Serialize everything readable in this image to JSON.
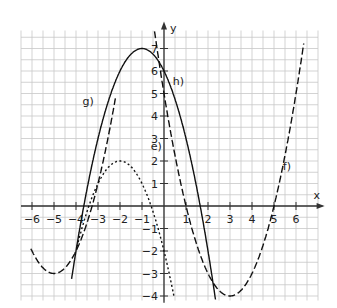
{
  "chart_data": {
    "type": "line",
    "title": "",
    "xlabel": "x",
    "ylabel": "y",
    "xlim": [
      -6.3,
      7
    ],
    "ylim": [
      -4.2,
      7.8
    ],
    "x_ticks": [
      -6,
      -5,
      -4,
      -3,
      -2,
      -1,
      1,
      2,
      3,
      4,
      5,
      6
    ],
    "y_ticks": [
      -4,
      -3,
      -2,
      -1,
      1,
      2,
      3,
      4,
      5,
      6,
      7
    ],
    "grid": true,
    "grid_step": 0.5,
    "series": [
      {
        "name": "e)",
        "style": "dotted",
        "formula": "-(x+2)^2+2",
        "vertex": [
          -2,
          2
        ],
        "points": [
          [
            -3.9,
            -1.6
          ],
          [
            -3,
            1
          ],
          [
            -2,
            2
          ],
          [
            -1,
            1
          ],
          [
            0,
            -2
          ],
          [
            0.4,
            -3.8
          ]
        ]
      },
      {
        "name": "g)",
        "style": "solid",
        "formula": "-(x+1)^2+7",
        "vertex": [
          -1,
          7
        ],
        "points": [
          [
            -4,
            -2
          ],
          [
            -3,
            3
          ],
          [
            -2,
            6
          ],
          [
            -1,
            7
          ],
          [
            0,
            6
          ],
          [
            1,
            3
          ],
          [
            2,
            -2
          ],
          [
            2.3,
            -3.9
          ]
        ]
      },
      {
        "name": "f)",
        "style": "dashed",
        "formula": "(x-3)^2-4",
        "vertex": [
          3,
          -4
        ],
        "points": [
          [
            -0.4,
            7.6
          ],
          [
            0,
            5
          ],
          [
            1,
            0
          ],
          [
            2,
            -3
          ],
          [
            3,
            -4
          ],
          [
            4,
            -3
          ],
          [
            5,
            0
          ],
          [
            5.8,
            3.8
          ],
          [
            6.2,
            7.6
          ]
        ]
      },
      {
        "name": "h)",
        "style": "dashed",
        "formula": "(x+5)^2-3",
        "vertex": [
          -5,
          -3
        ],
        "points": [
          [
            -6,
            -2
          ],
          [
            -5,
            -3
          ],
          [
            -4,
            -2
          ],
          [
            -3,
            1
          ],
          [
            -2.3,
            4.3
          ],
          [
            -2.2,
            7.6
          ]
        ]
      }
    ],
    "labels": [
      {
        "text": "e)",
        "x": -0.6,
        "y": 2.5
      },
      {
        "text": "g)",
        "x": -3.7,
        "y": 4.5
      },
      {
        "text": "h)",
        "x": 0.4,
        "y": 5.4
      },
      {
        "text": "f)",
        "x": 5.4,
        "y": 1.6
      }
    ]
  }
}
